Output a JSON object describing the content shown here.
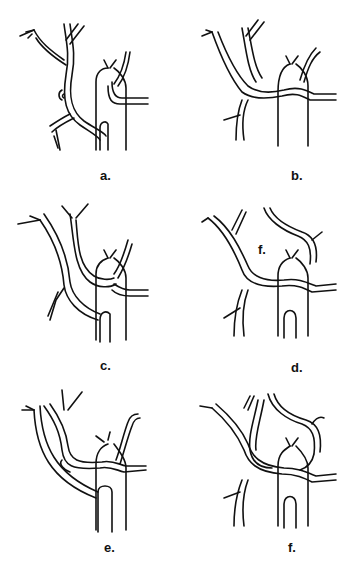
{
  "figure": {
    "panels": [
      {
        "id": "a",
        "label": "a."
      },
      {
        "id": "b",
        "label": "b."
      },
      {
        "id": "c",
        "label": "c."
      },
      {
        "id": "d",
        "label": "d.",
        "inner_label": "f."
      },
      {
        "id": "e",
        "label": "e."
      },
      {
        "id": "f",
        "label": "f."
      }
    ],
    "colors": {
      "line": "#111111",
      "background": "#ffffff"
    }
  }
}
